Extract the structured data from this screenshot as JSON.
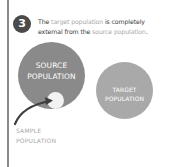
{
  "step": {
    "number": "3"
  },
  "caption": {
    "part1": "The ",
    "highlight1": "target population",
    "part2": " is completely",
    "part3": "external from the ",
    "highlight2": "source population",
    "part4": "."
  },
  "diagram": {
    "source": {
      "line1": "SOURCE",
      "line2": "POPULATION",
      "color": "#8a8a8a"
    },
    "target": {
      "line1": "TARGET",
      "line2": "POPULATION",
      "color": "#a9a9a9"
    },
    "sample": {
      "line1": "SAMPLE",
      "line2": "POPULATION",
      "color": "#f2f2f2"
    },
    "arrow_color": "#3f3f3f",
    "highlight_color": "#a8a8a8"
  }
}
